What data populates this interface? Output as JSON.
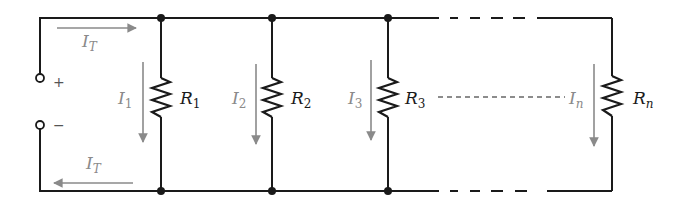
{
  "diagram": {
    "type": "parallel-resistor-circuit",
    "colors": {
      "wire": "#1a1a1a",
      "current_arrow": "#8a8a8a",
      "current_label": "#8a8a8a",
      "resistor_label": "#1a1a1a",
      "background": "#ffffff"
    },
    "source": {
      "positive_terminal": "+",
      "negative_terminal": "−"
    },
    "total_current": {
      "top": {
        "symbol": "I",
        "subscript": "T"
      },
      "bottom": {
        "symbol": "I",
        "subscript": "T"
      }
    },
    "branches": [
      {
        "resistor": {
          "symbol": "R",
          "subscript": "1"
        },
        "current": {
          "symbol": "I",
          "subscript": "1"
        }
      },
      {
        "resistor": {
          "symbol": "R",
          "subscript": "2"
        },
        "current": {
          "symbol": "I",
          "subscript": "2"
        }
      },
      {
        "resistor": {
          "symbol": "R",
          "subscript": "3"
        },
        "current": {
          "symbol": "I",
          "subscript": "3"
        }
      },
      {
        "resistor": {
          "symbol": "R",
          "subscript": "n"
        },
        "current": {
          "symbol": "I",
          "subscript": "n"
        }
      }
    ]
  }
}
